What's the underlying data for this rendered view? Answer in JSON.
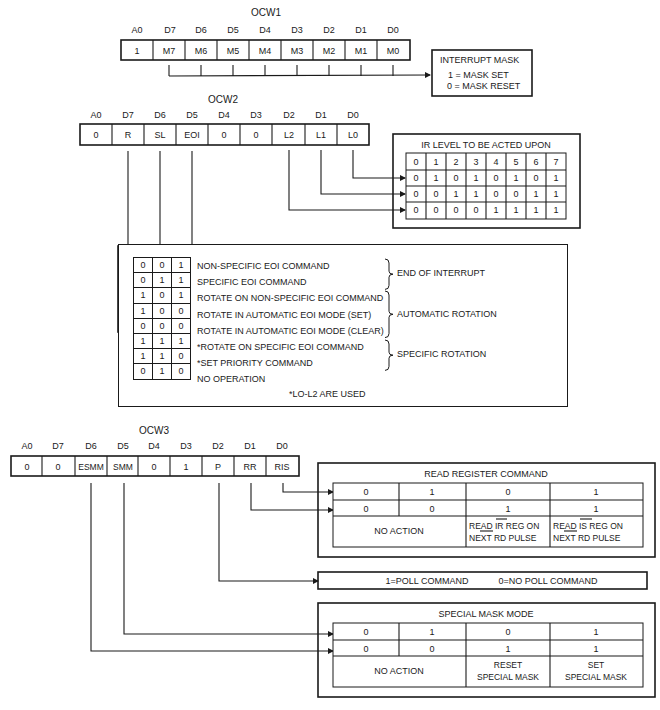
{
  "ocw1": {
    "title": "OCW1",
    "bit_labels": [
      "A0",
      "D7",
      "D6",
      "D5",
      "D4",
      "D3",
      "D2",
      "D1",
      "D0"
    ],
    "cells": [
      "1",
      "M7",
      "M6",
      "M5",
      "M4",
      "M3",
      "M2",
      "M1",
      "M0"
    ],
    "interrupt_mask": {
      "title": "INTERRUPT MASK",
      "line1": "1 = MASK SET",
      "line2": "0 = MASK RESET"
    }
  },
  "ocw2": {
    "title": "OCW2",
    "bit_labels": [
      "A0",
      "D7",
      "D6",
      "D5",
      "D4",
      "D3",
      "D2",
      "D1",
      "D0"
    ],
    "cells": [
      "0",
      "R",
      "SL",
      "EOI",
      "0",
      "0",
      "L2",
      "L1",
      "L0"
    ],
    "ir_level": {
      "title": "IR LEVEL TO BE ACTED UPON",
      "header": [
        "0",
        "1",
        "2",
        "3",
        "4",
        "5",
        "6",
        "7"
      ],
      "rows": [
        [
          "0",
          "1",
          "0",
          "1",
          "0",
          "1",
          "0",
          "1"
        ],
        [
          "0",
          "0",
          "1",
          "1",
          "0",
          "0",
          "1",
          "1"
        ],
        [
          "0",
          "0",
          "0",
          "0",
          "1",
          "1",
          "1",
          "1"
        ]
      ]
    },
    "commands": [
      {
        "bits": [
          "0",
          "0",
          "1"
        ],
        "label": "NON-SPECIFIC EOI COMMAND"
      },
      {
        "bits": [
          "0",
          "1",
          "1"
        ],
        "label": "SPECIFIC EOI COMMAND"
      },
      {
        "bits": [
          "1",
          "0",
          "1"
        ],
        "label": "ROTATE ON NON-SPECIFIC EOI COMMAND"
      },
      {
        "bits": [
          "1",
          "0",
          "0"
        ],
        "label": "ROTATE IN AUTOMATIC EOI MODE (SET)"
      },
      {
        "bits": [
          "0",
          "0",
          "0"
        ],
        "label": "ROTATE IN AUTOMATIC EOI MODE (CLEAR)"
      },
      {
        "bits": [
          "1",
          "1",
          "1"
        ],
        "label": "*ROTATE ON SPECIFIC EOI COMMAND"
      },
      {
        "bits": [
          "1",
          "1",
          "0"
        ],
        "label": "*SET PRIORITY COMMAND"
      },
      {
        "bits": [
          "0",
          "1",
          "0"
        ],
        "label": "NO OPERATION"
      }
    ],
    "groups": [
      "END OF INTERRUPT",
      "AUTOMATIC ROTATION",
      "SPECIFIC ROTATION"
    ],
    "footnote": "*LO-L2 ARE USED"
  },
  "ocw3": {
    "title": "OCW3",
    "bit_labels": [
      "A0",
      "D7",
      "D6",
      "D5",
      "D4",
      "D3",
      "D2",
      "D1",
      "D0"
    ],
    "cells": [
      "0",
      "0",
      "ESMM",
      "SMM",
      "0",
      "1",
      "P",
      "RR",
      "RIS"
    ],
    "read_register": {
      "title": "READ REGISTER COMMAND",
      "row1": [
        "0",
        "1",
        "0",
        "1"
      ],
      "row2": [
        "0",
        "0",
        "1",
        "1"
      ],
      "no_action": "NO ACTION",
      "ir_line1": "READ IR REG ON",
      "ir_line2": "NEXT RD PULSE",
      "is_line1": "READ IS REG ON",
      "is_line2": "NEXT RD PULSE"
    },
    "poll": {
      "one": "1=POLL COMMAND",
      "zero": "0=NO POLL COMMAND"
    },
    "special_mask": {
      "title": "SPECIAL MASK MODE",
      "row1": [
        "0",
        "1",
        "0",
        "1"
      ],
      "row2": [
        "0",
        "0",
        "1",
        "1"
      ],
      "no_action": "NO ACTION",
      "reset_line1": "RESET",
      "reset_line2": "SPECIAL MASK",
      "set_line1": "SET",
      "set_line2": "SPECIAL MASK"
    }
  }
}
